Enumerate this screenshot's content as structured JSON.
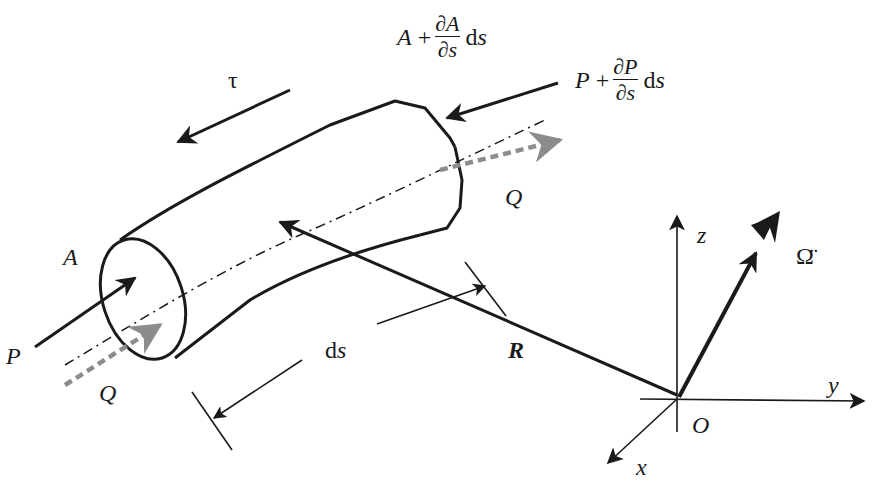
{
  "figure": {
    "colors": {
      "ink": "#1a1a1a",
      "flow_gray": "#8c8c8c",
      "background": "#ffffff"
    }
  },
  "labels": {
    "tau": "τ",
    "A_left": "A",
    "P_left": "P",
    "Q_left": "Q",
    "Q_right": "Q",
    "ds": {
      "d": "d",
      "s": "s"
    },
    "R": "R",
    "O": "O",
    "x": "x",
    "y": "y",
    "z": "z",
    "omega_ddot": "Ω̈",
    "A_right": {
      "base": "A",
      "plus": "+",
      "num": "∂A",
      "den": "∂s",
      "d": "d",
      "s": "s"
    },
    "P_right": {
      "base": "P",
      "plus": "+",
      "num": "∂P",
      "den": "∂s",
      "d": "d",
      "s": "s"
    }
  },
  "elements": {
    "tube": "curved tube segment with elliptical left end and angled right end",
    "centerline": "dash-dot centerline",
    "flow_arrows": "gray dashed arrows marking flow Q in and out",
    "force_arrows": [
      "P at left end",
      "P + ∂P/∂s ds at right end",
      "shear τ along tube"
    ],
    "position_vector": "R from O to tube centerline",
    "axes": [
      "x",
      "y",
      "z"
    ],
    "angular_acceleration": "double-headed arrow Ω̈"
  }
}
